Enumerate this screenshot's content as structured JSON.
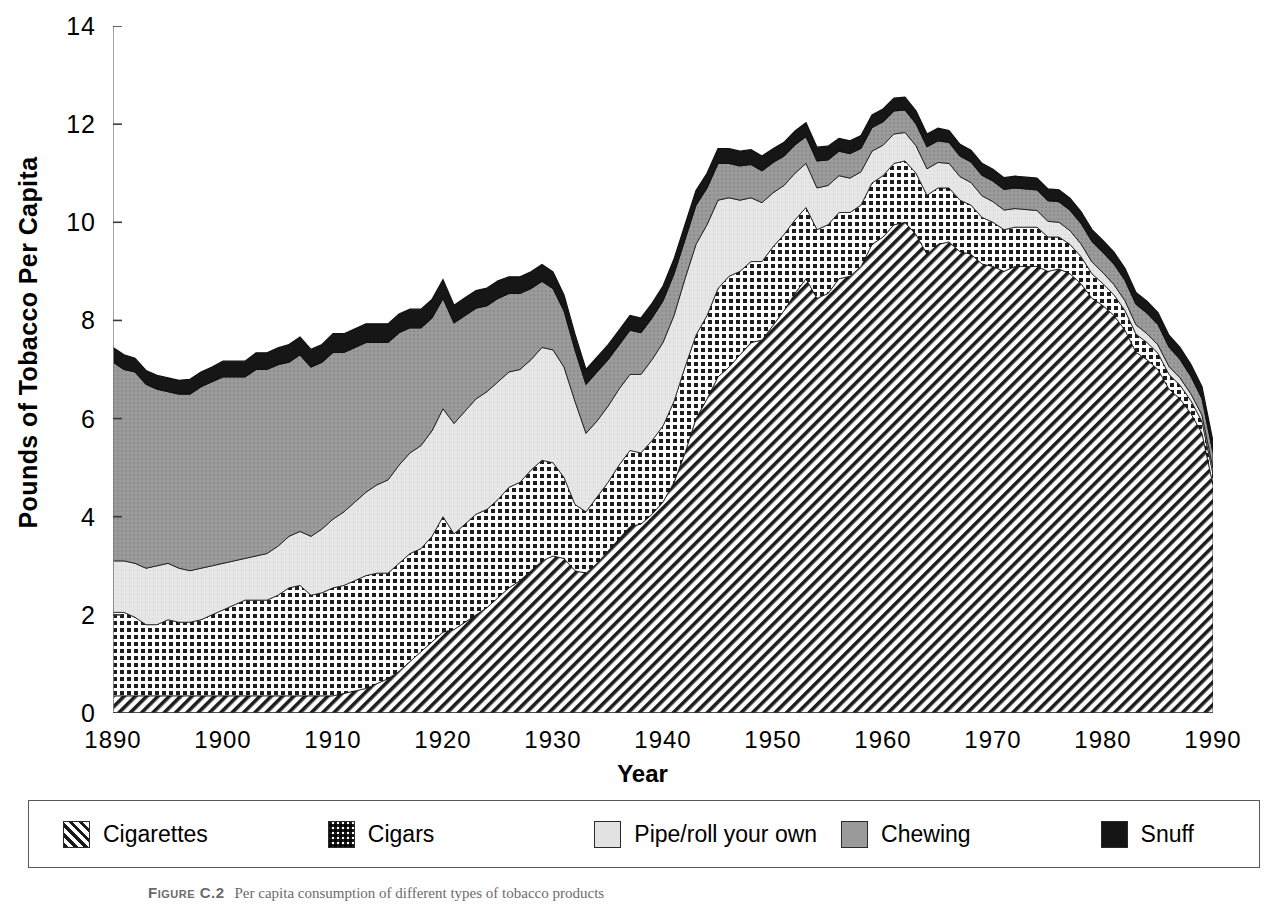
{
  "axes": {
    "ylabel": "Pounds of Tobacco Per Capita",
    "xlabel": "Year",
    "yticks": [
      "0",
      "2",
      "4",
      "6",
      "8",
      "10",
      "12",
      "14"
    ],
    "xticks": [
      "1890",
      "1900",
      "1910",
      "1920",
      "1930",
      "1940",
      "1950",
      "1960",
      "1970",
      "1980",
      "1990"
    ]
  },
  "legend": {
    "items": [
      {
        "label": "Cigarettes",
        "swatch": "cigarettes-swatch-diagonal-hatch",
        "color": "#1a1a1a"
      },
      {
        "label": "Cigars",
        "swatch": "cigars-swatch-checkerboard",
        "color": "#1a1a1a"
      },
      {
        "label": "Pipe/roll your own",
        "swatch": "pipe-swatch-light-gray",
        "color": "#e2e2e2"
      },
      {
        "label": "Chewing",
        "swatch": "chewing-swatch-medium-gray",
        "color": "#9a9a9a"
      },
      {
        "label": "Snuff",
        "swatch": "snuff-swatch-black",
        "color": "#141414"
      }
    ]
  },
  "caption": {
    "figure_label": "Figure C.2",
    "text": "Per capita consumption of different types of tobacco products"
  },
  "chart_data": {
    "type": "area",
    "stacked": true,
    "title": "",
    "xlabel": "Year",
    "ylabel": "Pounds of Tobacco Per Capita",
    "xlim": [
      1890,
      1990
    ],
    "ylim": [
      0,
      14
    ],
    "grid": false,
    "legend_position": "bottom",
    "x": [
      1890,
      1891,
      1892,
      1893,
      1894,
      1895,
      1896,
      1897,
      1898,
      1899,
      1900,
      1901,
      1902,
      1903,
      1904,
      1905,
      1906,
      1907,
      1908,
      1909,
      1910,
      1911,
      1912,
      1913,
      1914,
      1915,
      1916,
      1917,
      1918,
      1919,
      1920,
      1921,
      1922,
      1923,
      1924,
      1925,
      1926,
      1927,
      1928,
      1929,
      1930,
      1931,
      1932,
      1933,
      1934,
      1935,
      1936,
      1937,
      1938,
      1939,
      1940,
      1941,
      1942,
      1943,
      1944,
      1945,
      1946,
      1947,
      1948,
      1949,
      1950,
      1951,
      1952,
      1953,
      1954,
      1955,
      1956,
      1957,
      1958,
      1959,
      1960,
      1961,
      1962,
      1963,
      1964,
      1965,
      1966,
      1967,
      1968,
      1969,
      1970,
      1971,
      1972,
      1973,
      1974,
      1975,
      1976,
      1977,
      1978,
      1979,
      1980,
      1981,
      1982,
      1983,
      1984,
      1985,
      1986,
      1987,
      1988,
      1989,
      1990
    ],
    "series": [
      {
        "name": "Cigarettes",
        "values": [
          0.35,
          0.35,
          0.35,
          0.35,
          0.35,
          0.35,
          0.35,
          0.35,
          0.35,
          0.35,
          0.35,
          0.35,
          0.35,
          0.35,
          0.35,
          0.35,
          0.35,
          0.35,
          0.35,
          0.35,
          0.35,
          0.4,
          0.45,
          0.5,
          0.6,
          0.7,
          0.85,
          1.05,
          1.25,
          1.45,
          1.65,
          1.7,
          1.85,
          2.0,
          2.15,
          2.35,
          2.55,
          2.7,
          2.9,
          3.1,
          3.2,
          3.15,
          2.9,
          2.85,
          3.05,
          3.3,
          3.55,
          3.8,
          3.85,
          4.05,
          4.3,
          4.7,
          5.3,
          6.0,
          6.4,
          6.85,
          7.05,
          7.3,
          7.55,
          7.6,
          7.9,
          8.2,
          8.55,
          8.85,
          8.45,
          8.55,
          8.85,
          8.9,
          9.1,
          9.55,
          9.7,
          9.95,
          10.0,
          9.75,
          9.35,
          9.55,
          9.6,
          9.4,
          9.35,
          9.15,
          9.1,
          9.0,
          9.1,
          9.1,
          9.1,
          9.0,
          9.05,
          8.95,
          8.75,
          8.45,
          8.3,
          8.1,
          7.8,
          7.35,
          7.2,
          7.0,
          6.6,
          6.4,
          6.1,
          5.7,
          4.65
        ]
      },
      {
        "name": "Cigars",
        "values": [
          1.7,
          1.7,
          1.6,
          1.45,
          1.45,
          1.55,
          1.5,
          1.5,
          1.55,
          1.65,
          1.75,
          1.85,
          1.95,
          1.95,
          1.95,
          2.05,
          2.2,
          2.25,
          2.05,
          2.1,
          2.2,
          2.2,
          2.25,
          2.3,
          2.25,
          2.15,
          2.2,
          2.2,
          2.1,
          2.15,
          2.35,
          1.95,
          2.0,
          2.05,
          2.0,
          2.0,
          2.05,
          2.0,
          2.05,
          2.05,
          1.9,
          1.65,
          1.35,
          1.25,
          1.35,
          1.4,
          1.5,
          1.55,
          1.45,
          1.5,
          1.55,
          1.65,
          1.75,
          1.7,
          1.7,
          1.8,
          1.85,
          1.7,
          1.65,
          1.6,
          1.6,
          1.55,
          1.5,
          1.45,
          1.4,
          1.4,
          1.35,
          1.3,
          1.25,
          1.25,
          1.25,
          1.25,
          1.25,
          1.25,
          1.2,
          1.15,
          1.1,
          1.05,
          1.0,
          0.95,
          0.9,
          0.85,
          0.8,
          0.8,
          0.8,
          0.7,
          0.65,
          0.6,
          0.55,
          0.5,
          0.45,
          0.42,
          0.4,
          0.37,
          0.35,
          0.33,
          0.3,
          0.28,
          0.26,
          0.24,
          0.22
        ]
      },
      {
        "name": "Pipe/roll your own",
        "values": [
          1.05,
          1.05,
          1.1,
          1.15,
          1.2,
          1.15,
          1.1,
          1.05,
          1.05,
          1.0,
          0.95,
          0.9,
          0.85,
          0.9,
          0.95,
          1.0,
          1.05,
          1.1,
          1.2,
          1.3,
          1.4,
          1.5,
          1.6,
          1.7,
          1.8,
          1.9,
          2.0,
          2.05,
          2.1,
          2.15,
          2.2,
          2.25,
          2.3,
          2.35,
          2.4,
          2.4,
          2.35,
          2.3,
          2.25,
          2.3,
          2.3,
          2.25,
          2.1,
          1.6,
          1.55,
          1.55,
          1.55,
          1.55,
          1.6,
          1.65,
          1.7,
          1.75,
          1.8,
          1.85,
          1.85,
          1.8,
          1.6,
          1.45,
          1.3,
          1.2,
          1.1,
          1.0,
          0.95,
          0.9,
          0.85,
          0.8,
          0.75,
          0.7,
          0.68,
          0.65,
          0.62,
          0.6,
          0.58,
          0.56,
          0.54,
          0.52,
          0.5,
          0.48,
          0.46,
          0.44,
          0.42,
          0.4,
          0.38,
          0.36,
          0.34,
          0.32,
          0.3,
          0.28,
          0.26,
          0.24,
          0.22,
          0.21,
          0.2,
          0.19,
          0.18,
          0.17,
          0.16,
          0.15,
          0.14,
          0.13,
          0.12
        ]
      },
      {
        "name": "Chewing",
        "values": [
          4.05,
          3.9,
          3.9,
          3.75,
          3.6,
          3.5,
          3.55,
          3.6,
          3.7,
          3.75,
          3.8,
          3.75,
          3.7,
          3.8,
          3.75,
          3.7,
          3.55,
          3.6,
          3.45,
          3.4,
          3.4,
          3.25,
          3.15,
          3.05,
          2.9,
          2.8,
          2.7,
          2.55,
          2.4,
          2.3,
          2.25,
          2.05,
          1.95,
          1.85,
          1.75,
          1.7,
          1.6,
          1.55,
          1.45,
          1.35,
          1.25,
          1.15,
          1.05,
          1.0,
          1.0,
          0.95,
          0.9,
          0.9,
          0.85,
          0.85,
          0.85,
          0.85,
          0.8,
          0.8,
          0.75,
          0.75,
          0.7,
          0.7,
          0.68,
          0.65,
          0.62,
          0.6,
          0.58,
          0.55,
          0.55,
          0.52,
          0.5,
          0.5,
          0.48,
          0.48,
          0.48,
          0.47,
          0.46,
          0.45,
          0.45,
          0.44,
          0.43,
          0.42,
          0.42,
          0.42,
          0.42,
          0.42,
          0.42,
          0.42,
          0.42,
          0.42,
          0.42,
          0.42,
          0.42,
          0.42,
          0.42,
          0.42,
          0.42,
          0.42,
          0.42,
          0.42,
          0.4,
          0.38,
          0.36,
          0.34,
          0.32
        ]
      },
      {
        "name": "Snuff",
        "values": [
          0.3,
          0.3,
          0.28,
          0.28,
          0.28,
          0.28,
          0.28,
          0.3,
          0.3,
          0.3,
          0.32,
          0.32,
          0.32,
          0.34,
          0.34,
          0.34,
          0.36,
          0.36,
          0.36,
          0.36,
          0.38,
          0.38,
          0.38,
          0.38,
          0.38,
          0.38,
          0.38,
          0.38,
          0.38,
          0.38,
          0.38,
          0.36,
          0.36,
          0.36,
          0.36,
          0.36,
          0.34,
          0.34,
          0.34,
          0.34,
          0.34,
          0.32,
          0.32,
          0.3,
          0.3,
          0.3,
          0.3,
          0.3,
          0.3,
          0.3,
          0.3,
          0.3,
          0.3,
          0.3,
          0.3,
          0.3,
          0.3,
          0.3,
          0.3,
          0.3,
          0.28,
          0.28,
          0.28,
          0.28,
          0.28,
          0.28,
          0.26,
          0.26,
          0.26,
          0.26,
          0.26,
          0.26,
          0.26,
          0.26,
          0.26,
          0.26,
          0.24,
          0.24,
          0.24,
          0.24,
          0.24,
          0.24,
          0.24,
          0.24,
          0.24,
          0.24,
          0.24,
          0.24,
          0.24,
          0.24,
          0.24,
          0.24,
          0.24,
          0.24,
          0.24,
          0.24,
          0.24,
          0.24,
          0.24,
          0.24,
          0.22
        ]
      }
    ]
  }
}
